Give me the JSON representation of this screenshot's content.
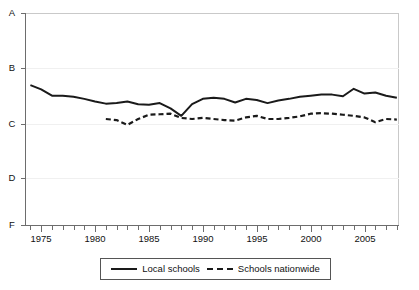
{
  "chart_data": {
    "type": "line",
    "title": "",
    "subtitle": "",
    "xlabel": "",
    "ylabel": "",
    "grid": true,
    "legend_position": "bottom",
    "xlim": [
      1973.5,
      2008.2
    ],
    "ylim": [
      0,
      4
    ],
    "ytick_labels": [
      "A",
      "B",
      "C",
      "D",
      "F"
    ],
    "ytick_values": [
      4,
      3,
      2,
      1,
      0
    ],
    "ytick_pixel_y": [
      13,
      68,
      124,
      178,
      225
    ],
    "xtick_labels": [
      "1975",
      "1980",
      "1985",
      "1990",
      "1995",
      "2000",
      "2005"
    ],
    "xtick_values": [
      1975,
      1980,
      1985,
      1990,
      1995,
      2000,
      2005
    ],
    "xtick_minor_step": 1,
    "series": [
      {
        "name": "Local schools",
        "style": "solid",
        "color": "#1a1a1a",
        "x": [
          1974,
          1975,
          1976,
          1977,
          1978,
          1979,
          1980,
          1981,
          1982,
          1983,
          1984,
          1985,
          1986,
          1987,
          1988,
          1989,
          1990,
          1991,
          1992,
          1993,
          1994,
          1995,
          1996,
          1997,
          1998,
          1999,
          2000,
          2001,
          2002,
          2003,
          2004,
          2005,
          2006,
          2007,
          2008
        ],
        "values": [
          2.64,
          2.56,
          2.44,
          2.44,
          2.42,
          2.38,
          2.33,
          2.29,
          2.3,
          2.33,
          2.28,
          2.27,
          2.3,
          2.2,
          2.06,
          2.28,
          2.38,
          2.4,
          2.38,
          2.31,
          2.38,
          2.36,
          2.3,
          2.35,
          2.38,
          2.42,
          2.44,
          2.46,
          2.46,
          2.43,
          2.57,
          2.48,
          2.5,
          2.44,
          2.4
        ]
      },
      {
        "name": "Schools nationwide",
        "style": "dashed",
        "color": "#1a1a1a",
        "x": [
          1981,
          1982,
          1983,
          1984,
          1985,
          1986,
          1987,
          1988,
          1989,
          1990,
          1991,
          1992,
          1993,
          1994,
          1995,
          1996,
          1997,
          1998,
          1999,
          2000,
          2001,
          2002,
          2003,
          2004,
          2005,
          2006,
          2007,
          2008
        ],
        "values": [
          2.0,
          1.98,
          1.89,
          2.0,
          2.08,
          2.09,
          2.1,
          2.02,
          2.0,
          2.02,
          2.0,
          1.98,
          1.97,
          2.03,
          2.06,
          2.0,
          2.0,
          2.02,
          2.05,
          2.1,
          2.11,
          2.1,
          2.08,
          2.06,
          2.03,
          1.94,
          2.0,
          1.99
        ]
      }
    ]
  },
  "axis": {
    "y_labels": [
      "A",
      "B",
      "C",
      "D",
      "F"
    ],
    "x_labels": [
      "1975",
      "1980",
      "1985",
      "1990",
      "1995",
      "2000",
      "2005"
    ]
  },
  "legend": {
    "entries": [
      {
        "label": "Local schools",
        "style": "solid"
      },
      {
        "label": "Schools nationwide",
        "style": "dashed"
      }
    ]
  }
}
